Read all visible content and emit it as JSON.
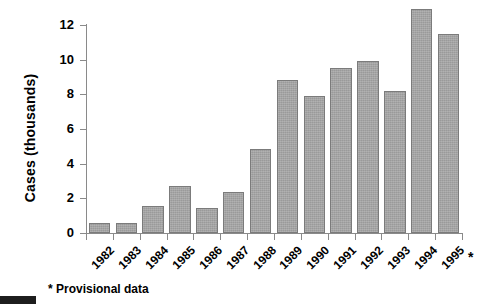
{
  "chart_data": {
    "type": "bar",
    "title": "",
    "xlabel": "",
    "ylabel": "Cases (thousands)",
    "categories": [
      "1982",
      "1983",
      "1984",
      "1985",
      "1986",
      "1987",
      "1988",
      "1989",
      "1990",
      "1991",
      "1992",
      "1993",
      "1994",
      "1995"
    ],
    "values": [
      0.55,
      0.6,
      1.55,
      2.7,
      1.45,
      2.35,
      4.85,
      8.8,
      7.9,
      9.5,
      9.9,
      8.2,
      12.9,
      11.5
    ],
    "ylim": [
      0,
      13.5
    ],
    "y_ticks": [
      0,
      2,
      4,
      6,
      8,
      10,
      12
    ],
    "y_tick_labels": [
      "0",
      "2",
      "4",
      "6",
      "8",
      "10",
      "12"
    ],
    "grid": false,
    "legend": null,
    "bar_color": "#9a9a9a",
    "bar_edge_color": "#7b7b7b",
    "axis_color": "#8a8a8a",
    "annotations": [
      {
        "name": "provisional-marker",
        "text": "*",
        "target": "1995"
      },
      {
        "name": "footnote",
        "text": "* Provisional data"
      }
    ]
  },
  "axis": {
    "y_title": "Cases (thousands)",
    "asterisk": "*"
  },
  "footnote": {
    "text": "* Provisional data"
  }
}
